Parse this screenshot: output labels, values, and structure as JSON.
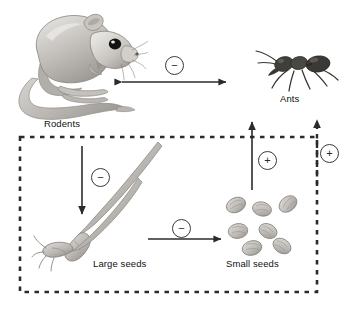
{
  "figure": {
    "type": "ecological-interaction-diagram",
    "background": "#ffffff",
    "width": 345,
    "height": 313
  },
  "nodes": {
    "rodents": {
      "label": "Rodents",
      "icon": "kangaroo-rat-illustration"
    },
    "ants": {
      "label": "Ants",
      "icon": "ant-illustration"
    },
    "large_seeds": {
      "label": "Large seeds",
      "icon": "large-seed-illustration"
    },
    "small_seeds": {
      "label": "Small seeds",
      "icon": "small-seed-cluster-illustration"
    }
  },
  "signs": {
    "rodents_ants": "−",
    "rodents_large_seeds": "−",
    "large_to_small_seeds": "−",
    "small_seeds_ants": "+",
    "seedbox_ants": "+"
  },
  "edges": [
    {
      "id": "rodents-ants",
      "from": "Rodents",
      "to": "Ants",
      "sign": "−",
      "style": "solid",
      "arrowheads": "both",
      "orientation": "horizontal"
    },
    {
      "id": "rodents-large-seeds",
      "from": "Rodents",
      "to": "Large seeds",
      "sign": "−",
      "style": "solid",
      "arrowheads": "end",
      "orientation": "vertical-down"
    },
    {
      "id": "large-small-seeds",
      "from": "Large seeds",
      "to": "Small seeds",
      "sign": "−",
      "style": "solid",
      "arrowheads": "end",
      "orientation": "horizontal-right"
    },
    {
      "id": "small-seeds-ants",
      "from": "Small seeds",
      "to": "Ants",
      "sign": "+",
      "style": "solid",
      "arrowheads": "end",
      "orientation": "vertical-up"
    },
    {
      "id": "seedbox-ants",
      "from": "Seed compartment",
      "to": "Ants",
      "sign": "+",
      "style": "dashed",
      "arrowheads": "end",
      "orientation": "vertical-up"
    }
  ],
  "compartment": {
    "name": "seed-compartment",
    "style": "dashed-border",
    "color": "#2b2b2b"
  },
  "colors": {
    "line": "#2b2b2b",
    "sign_border": "#3a3a3a",
    "text": "#111111",
    "fur_light": "#d8d6d3",
    "fur_mid": "#b3b0ac",
    "fur_dark": "#8c8984",
    "ant_dark": "#3c3a38",
    "seed_fill": "#c9c6c2",
    "seed_shade": "#a4a19d"
  }
}
